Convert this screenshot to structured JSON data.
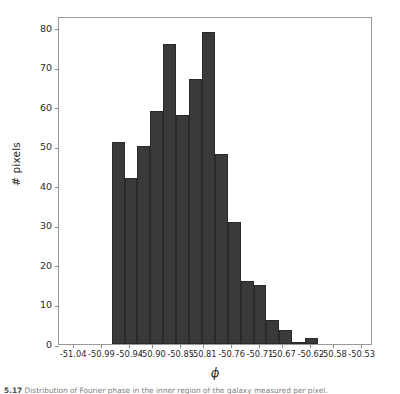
{
  "figure": {
    "caption_number": "5.17",
    "caption_text": "Distribution of Fourier phase in the inner region of the galaxy measured per pixel."
  },
  "chart_data": {
    "type": "bar",
    "title": "",
    "subtitle": "",
    "xlabel": "ϕ",
    "ylabel": "# pixels",
    "grid": false,
    "legend": null,
    "bar_color": "#3a3a3a",
    "edge_color": "#2a2a2a",
    "xlim": [
      -51.065,
      -50.51
    ],
    "ylim": [
      0,
      83
    ],
    "xticks": [
      -51.04,
      -50.99,
      -50.94,
      -50.9,
      -50.85,
      -50.81,
      -50.76,
      -50.71,
      -50.67,
      -50.62,
      -50.58,
      -50.53
    ],
    "xtick_labels": [
      "-51.04",
      "-50.99",
      "-50.94",
      "-50.90",
      "-50.85",
      "-50.81",
      "-50.76",
      "-50.71",
      "-50.67",
      "-50.62",
      "-50.58",
      "-50.53"
    ],
    "yticks": [
      0,
      10,
      20,
      30,
      40,
      50,
      60,
      70,
      80
    ],
    "ytick_labels": [
      "0",
      "10",
      "20",
      "30",
      "40",
      "50",
      "60",
      "70",
      "80"
    ],
    "bin_edges": [
      -50.972,
      -50.9492,
      -50.9264,
      -50.9036,
      -50.8808,
      -50.858,
      -50.8352,
      -50.8124,
      -50.7896,
      -50.7668,
      -50.744,
      -50.7212,
      -50.6984,
      -50.6756,
      -50.6528,
      -50.63,
      -50.6072
    ],
    "bin_centers": [
      -50.9606,
      -50.9378,
      -50.915,
      -50.8922,
      -50.8694,
      -50.8466,
      -50.8238,
      -50.801,
      -50.7782,
      -50.7554,
      -50.7326,
      -50.7098,
      -50.687,
      -50.6642,
      -50.6414,
      -50.6186
    ],
    "values": [
      51,
      42,
      50,
      59,
      76,
      58,
      67,
      79,
      48,
      31,
      16,
      15,
      6,
      3.5,
      0.5,
      1.5
    ]
  }
}
